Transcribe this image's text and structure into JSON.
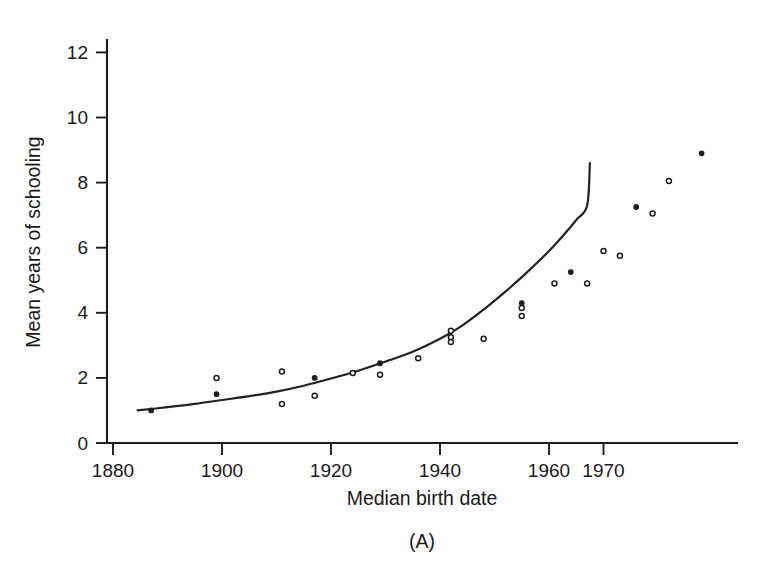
{
  "chart_data": {
    "type": "scatter",
    "title": "",
    "subtitle": "",
    "panel_label": "(A)",
    "xlabel": "Median birth date",
    "ylabel": "Mean years of schooling",
    "xlim": [
      1878,
      1971
    ],
    "ylim": [
      0,
      12.6
    ],
    "xticks": [
      1880,
      1900,
      1920,
      1940,
      1960,
      1970
    ],
    "xtick_labels": [
      "1880",
      "1900",
      "1920",
      "1940",
      "1960",
      "1970"
    ],
    "yticks": [
      0,
      2,
      4,
      6,
      8,
      10,
      12
    ],
    "ytick_labels": [
      "0",
      "2",
      "4",
      "6",
      "8",
      "10",
      "12"
    ],
    "grid": false,
    "legend": "none",
    "marker": "small circle",
    "series": [
      {
        "name": "Mean years of schooling by median birth cohort",
        "points": [
          {
            "x": 1887,
            "y": 1.0,
            "style": "filled"
          },
          {
            "x": 1899,
            "y": 2.0,
            "style": "open"
          },
          {
            "x": 1899,
            "y": 1.5,
            "style": "filled"
          },
          {
            "x": 1911,
            "y": 2.2,
            "style": "open"
          },
          {
            "x": 1911,
            "y": 1.2,
            "style": "open"
          },
          {
            "x": 1917,
            "y": 2.0,
            "style": "filled"
          },
          {
            "x": 1917,
            "y": 1.45,
            "style": "open"
          },
          {
            "x": 1924,
            "y": 2.15,
            "style": "open"
          },
          {
            "x": 1929,
            "y": 2.45,
            "style": "filled"
          },
          {
            "x": 1929,
            "y": 2.1,
            "style": "open"
          },
          {
            "x": 1936,
            "y": 2.6,
            "style": "open"
          },
          {
            "x": 1942,
            "y": 3.45,
            "style": "open"
          },
          {
            "x": 1942,
            "y": 3.25,
            "style": "open"
          },
          {
            "x": 1942,
            "y": 3.1,
            "style": "open"
          },
          {
            "x": 1948,
            "y": 3.2,
            "style": "open"
          },
          {
            "x": 1955,
            "y": 4.3,
            "style": "filled"
          },
          {
            "x": 1955,
            "y": 4.15,
            "style": "open"
          },
          {
            "x": 1955,
            "y": 3.9,
            "style": "open"
          },
          {
            "x": 1961,
            "y": 4.9,
            "style": "open"
          },
          {
            "x": 1964,
            "y": 5.25,
            "style": "filled"
          },
          {
            "x": 1967,
            "y": 4.9,
            "style": "open"
          },
          {
            "x": 1970,
            "y": 5.9,
            "style": "open"
          },
          {
            "x": 1973,
            "y": 5.75,
            "style": "open"
          },
          {
            "x": 1976,
            "y": 7.25,
            "style": "filled"
          },
          {
            "x": 1979,
            "y": 7.05,
            "style": "open"
          },
          {
            "x": 1982,
            "y": 8.05,
            "style": "open"
          },
          {
            "x": 1988,
            "y": 8.9,
            "style": "filled"
          }
        ]
      }
    ],
    "fit_line": {
      "name": "smoothed trend",
      "points": [
        {
          "x": 1884.5,
          "y": 1.0
        },
        {
          "x": 1890,
          "y": 1.1
        },
        {
          "x": 1895,
          "y": 1.2
        },
        {
          "x": 1900,
          "y": 1.32
        },
        {
          "x": 1905,
          "y": 1.44
        },
        {
          "x": 1910,
          "y": 1.58
        },
        {
          "x": 1915,
          "y": 1.76
        },
        {
          "x": 1920,
          "y": 1.98
        },
        {
          "x": 1925,
          "y": 2.22
        },
        {
          "x": 1930,
          "y": 2.5
        },
        {
          "x": 1935,
          "y": 2.8
        },
        {
          "x": 1940,
          "y": 3.2
        },
        {
          "x": 1944,
          "y": 3.6
        },
        {
          "x": 1948,
          "y": 4.1
        },
        {
          "x": 1952,
          "y": 4.65
        },
        {
          "x": 1956,
          "y": 5.25
        },
        {
          "x": 1960,
          "y": 5.9
        },
        {
          "x": 1963,
          "y": 6.45
        },
        {
          "x": 1965,
          "y": 6.85
        },
        {
          "x": 1967,
          "y": 7.3
        },
        {
          "x": 1967.5,
          "y": 8.6
        }
      ]
    }
  },
  "axis_geometry": {
    "plot_left_px": 107,
    "plot_bottom_px": 443,
    "plot_right_px": 737,
    "plot_top_px": 40,
    "x_px_per_year": 5.45,
    "y_px_per_unit": 32.55,
    "x_origin_year": 1880,
    "x_origin_px": 113
  }
}
